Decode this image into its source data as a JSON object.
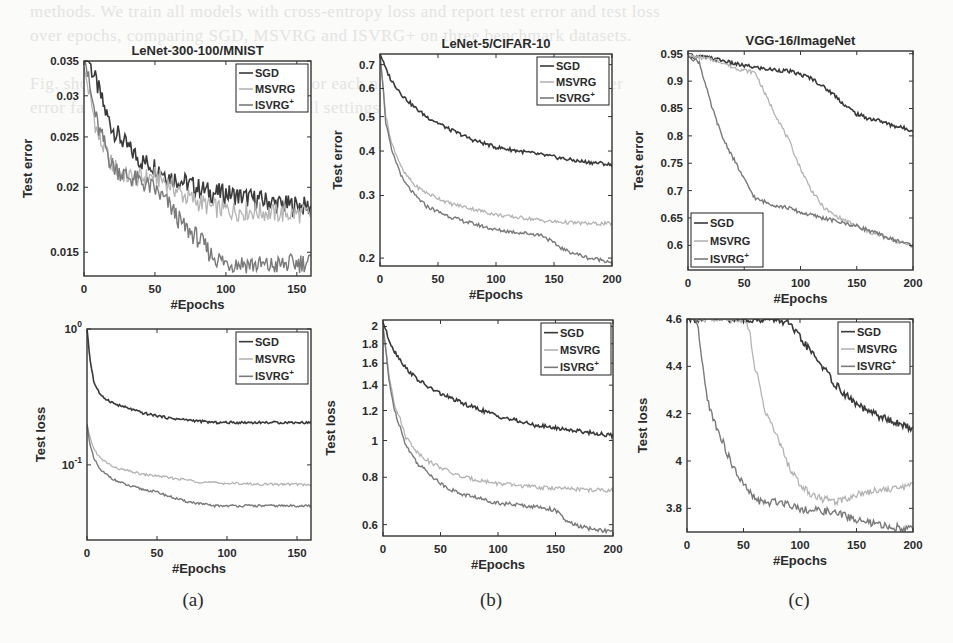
{
  "figure": {
    "background_text_lines": [
      "methods. We train all models with cross-entropy loss and report test error and test loss",
      "over epochs, comparing SGD, MSVRG and ISVRG+ on three benchmark datasets.",
      "",
      "Fig. shows the test error and test loss for each network. Our method attains lower",
      "error faster than the baselines across all settings considered in this experiment.",
      "",
      "",
      "",
      "",
      "",
      "",
      "",
      "",
      "",
      "",
      "",
      "",
      "",
      "",
      "",
      "",
      "",
      "",
      "",
      "",
      "",
      ""
    ],
    "captions": [
      "(a)",
      "(b)",
      "(c)"
    ],
    "series_colors": {
      "SGD": "#3a3a3a",
      "MSVRG": "#b4b4b4",
      "ISVRG+": "#7a7a7a"
    }
  },
  "chart_data": [
    {
      "type": "line",
      "panel": "a-top",
      "title": "LeNet-300-100/MNIST",
      "xlabel": "#Epochs",
      "ylabel": "Test error",
      "xlim": [
        0,
        160
      ],
      "ylim": [
        0.0135,
        0.035
      ],
      "yscale": "log",
      "xticks": [
        0,
        50,
        100,
        150
      ],
      "yticks": [
        0.015,
        0.02,
        0.025,
        0.03,
        0.035
      ],
      "ytick_labels": [
        "0.015",
        "0.02",
        "0.025",
        "0.03",
        "0.035"
      ],
      "legend": {
        "position": "upper right",
        "entries": [
          "SGD",
          "MSVRG",
          "ISVRG+"
        ]
      },
      "grid": false,
      "x": [
        0,
        5,
        10,
        15,
        20,
        25,
        30,
        40,
        50,
        60,
        70,
        80,
        90,
        100,
        110,
        120,
        130,
        140,
        150,
        160
      ],
      "series": [
        {
          "name": "SGD",
          "values": [
            0.038,
            0.034,
            0.031,
            0.028,
            0.026,
            0.025,
            0.024,
            0.0225,
            0.022,
            0.021,
            0.0205,
            0.02,
            0.0195,
            0.0195,
            0.0192,
            0.019,
            0.0188,
            0.0185,
            0.0185,
            0.0183
          ]
        },
        {
          "name": "MSVRG",
          "values": [
            0.034,
            0.029,
            0.025,
            0.0235,
            0.022,
            0.0215,
            0.021,
            0.0208,
            0.021,
            0.0203,
            0.0193,
            0.0188,
            0.0183,
            0.0181,
            0.018,
            0.018,
            0.0179,
            0.0178,
            0.0178,
            0.0178
          ]
        },
        {
          "name": "ISVRG+",
          "values": [
            0.036,
            0.03,
            0.026,
            0.024,
            0.022,
            0.0215,
            0.021,
            0.0205,
            0.0198,
            0.0185,
            0.0168,
            0.016,
            0.0148,
            0.0143,
            0.0143,
            0.0142,
            0.0141,
            0.0142,
            0.0143,
            0.0144
          ]
        }
      ]
    },
    {
      "type": "line",
      "panel": "b-top",
      "title": "LeNet-5/CIFAR-10",
      "xlabel": "#Epochs",
      "ylabel": "Test error",
      "xlim": [
        0,
        200
      ],
      "ylim": [
        0.19,
        0.75
      ],
      "yscale": "log",
      "xticks": [
        0,
        50,
        100,
        150,
        200
      ],
      "yticks": [
        0.2,
        0.3,
        0.4,
        0.5,
        0.6,
        0.7
      ],
      "ytick_labels": [
        "0.2",
        "0.3",
        "0.4",
        "0.5",
        "0.6",
        "0.7"
      ],
      "legend": {
        "position": "upper right",
        "entries": [
          "SGD",
          "MSVRG",
          "ISVRG+"
        ]
      },
      "grid": false,
      "x": [
        0,
        5,
        10,
        20,
        30,
        40,
        50,
        60,
        70,
        80,
        90,
        100,
        110,
        120,
        130,
        140,
        150,
        160,
        170,
        180,
        190,
        200
      ],
      "series": [
        {
          "name": "SGD",
          "values": [
            0.75,
            0.68,
            0.63,
            0.57,
            0.53,
            0.5,
            0.48,
            0.46,
            0.445,
            0.43,
            0.42,
            0.41,
            0.405,
            0.4,
            0.395,
            0.39,
            0.385,
            0.38,
            0.375,
            0.372,
            0.37,
            0.365
          ]
        },
        {
          "name": "MSVRG",
          "values": [
            0.74,
            0.5,
            0.42,
            0.35,
            0.32,
            0.305,
            0.295,
            0.285,
            0.28,
            0.275,
            0.27,
            0.265,
            0.262,
            0.26,
            0.258,
            0.255,
            0.253,
            0.252,
            0.251,
            0.25,
            0.25,
            0.25
          ]
        },
        {
          "name": "ISVRG+",
          "values": [
            0.74,
            0.48,
            0.4,
            0.33,
            0.3,
            0.28,
            0.27,
            0.262,
            0.255,
            0.25,
            0.245,
            0.24,
            0.238,
            0.236,
            0.234,
            0.232,
            0.22,
            0.21,
            0.205,
            0.2,
            0.198,
            0.195
          ]
        }
      ]
    },
    {
      "type": "line",
      "panel": "c-top",
      "title": "VGG-16/ImageNet",
      "xlabel": "#Epochs",
      "ylabel": "Test error",
      "xlim": [
        0,
        200
      ],
      "ylim": [
        0.555,
        0.955
      ],
      "yscale": "linear",
      "xticks": [
        0,
        50,
        100,
        150,
        200
      ],
      "yticks": [
        0.6,
        0.65,
        0.7,
        0.75,
        0.8,
        0.85,
        0.9,
        0.95
      ],
      "ytick_labels": [
        "0.6",
        "0.65",
        "0.7",
        "0.75",
        "0.8",
        "0.85",
        "0.9",
        "0.95"
      ],
      "legend": {
        "position": "lower left",
        "entries": [
          "SGD",
          "MSVRG",
          "ISVRG+"
        ]
      },
      "grid": false,
      "x": [
        0,
        10,
        20,
        30,
        40,
        50,
        60,
        70,
        80,
        90,
        100,
        110,
        120,
        130,
        140,
        150,
        160,
        170,
        180,
        190,
        200
      ],
      "series": [
        {
          "name": "SGD",
          "values": [
            0.945,
            0.945,
            0.942,
            0.938,
            0.932,
            0.928,
            0.925,
            0.922,
            0.92,
            0.918,
            0.912,
            0.905,
            0.89,
            0.875,
            0.855,
            0.84,
            0.832,
            0.828,
            0.82,
            0.815,
            0.81
          ]
        },
        {
          "name": "MSVRG",
          "values": [
            0.945,
            0.943,
            0.94,
            0.935,
            0.925,
            0.92,
            0.915,
            0.87,
            0.83,
            0.79,
            0.74,
            0.7,
            0.67,
            0.655,
            0.645,
            0.635,
            0.625,
            0.618,
            0.61,
            0.605,
            0.6
          ]
        },
        {
          "name": "ISVRG+",
          "values": [
            0.945,
            0.935,
            0.86,
            0.8,
            0.76,
            0.72,
            0.685,
            0.678,
            0.672,
            0.668,
            0.66,
            0.655,
            0.65,
            0.645,
            0.64,
            0.635,
            0.628,
            0.62,
            0.612,
            0.606,
            0.6
          ]
        }
      ]
    },
    {
      "type": "line",
      "panel": "a-bottom",
      "title": "",
      "xlabel": "#Epochs",
      "ylabel": "Test loss",
      "xlim": [
        0,
        160
      ],
      "ylim": [
        0.028,
        1.0
      ],
      "yscale": "log",
      "xticks": [
        0,
        50,
        100,
        150
      ],
      "yticks": [
        0.1,
        1.0
      ],
      "ytick_labels": [
        "10^-1",
        "10^0"
      ],
      "legend": {
        "position": "upper right",
        "entries": [
          "SGD",
          "MSVRG",
          "ISVRG+"
        ]
      },
      "grid": false,
      "x": [
        0,
        2,
        5,
        10,
        20,
        30,
        40,
        50,
        60,
        70,
        80,
        90,
        100,
        110,
        120,
        130,
        140,
        150,
        160
      ],
      "series": [
        {
          "name": "SGD",
          "values": [
            1.0,
            0.6,
            0.4,
            0.32,
            0.28,
            0.26,
            0.24,
            0.23,
            0.22,
            0.215,
            0.21,
            0.205,
            0.205,
            0.205,
            0.205,
            0.205,
            0.205,
            0.205,
            0.205
          ]
        },
        {
          "name": "MSVRG",
          "values": [
            0.2,
            0.16,
            0.13,
            0.11,
            0.095,
            0.09,
            0.085,
            0.083,
            0.08,
            0.078,
            0.075,
            0.074,
            0.073,
            0.073,
            0.072,
            0.072,
            0.072,
            0.072,
            0.071
          ]
        },
        {
          "name": "ISVRG+",
          "values": [
            0.2,
            0.14,
            0.11,
            0.09,
            0.077,
            0.07,
            0.066,
            0.063,
            0.058,
            0.054,
            0.052,
            0.05,
            0.05,
            0.05,
            0.05,
            0.05,
            0.05,
            0.05,
            0.05
          ]
        }
      ]
    },
    {
      "type": "line",
      "panel": "b-bottom",
      "title": "",
      "xlabel": "#Epochs",
      "ylabel": "Test loss",
      "xlim": [
        0,
        200
      ],
      "ylim": [
        0.56,
        2.08
      ],
      "yscale": "log",
      "xticks": [
        0,
        50,
        100,
        150,
        200
      ],
      "yticks": [
        0.6,
        0.8,
        1.0,
        1.2,
        1.4,
        1.6,
        1.8,
        2.0
      ],
      "ytick_labels": [
        "0.6",
        "0.8",
        "1",
        "1.2",
        "1.4",
        "1.6",
        "1.8",
        "2"
      ],
      "legend": {
        "position": "upper right",
        "entries": [
          "SGD",
          "MSVRG",
          "ISVRG+"
        ]
      },
      "grid": false,
      "x": [
        0,
        5,
        10,
        20,
        30,
        40,
        50,
        60,
        70,
        80,
        90,
        100,
        110,
        120,
        130,
        140,
        150,
        160,
        170,
        180,
        190,
        200
      ],
      "series": [
        {
          "name": "SGD",
          "values": [
            2.05,
            1.85,
            1.72,
            1.55,
            1.45,
            1.38,
            1.33,
            1.29,
            1.25,
            1.22,
            1.19,
            1.16,
            1.14,
            1.12,
            1.1,
            1.09,
            1.08,
            1.07,
            1.06,
            1.05,
            1.04,
            1.03
          ]
        },
        {
          "name": "MSVRG",
          "values": [
            2.0,
            1.5,
            1.25,
            1.02,
            0.93,
            0.88,
            0.85,
            0.82,
            0.8,
            0.79,
            0.78,
            0.77,
            0.765,
            0.76,
            0.755,
            0.75,
            0.75,
            0.745,
            0.745,
            0.74,
            0.74,
            0.74
          ]
        },
        {
          "name": "ISVRG+",
          "values": [
            2.0,
            1.45,
            1.2,
            0.97,
            0.87,
            0.82,
            0.77,
            0.74,
            0.72,
            0.71,
            0.695,
            0.685,
            0.68,
            0.675,
            0.67,
            0.665,
            0.655,
            0.61,
            0.595,
            0.585,
            0.58,
            0.575
          ]
        }
      ]
    },
    {
      "type": "line",
      "panel": "c-bottom",
      "title": "",
      "xlabel": "#Epochs",
      "ylabel": "Test loss",
      "xlim": [
        0,
        200
      ],
      "ylim": [
        3.7,
        4.6
      ],
      "yscale": "linear",
      "xticks": [
        0,
        50,
        100,
        150,
        200
      ],
      "yticks": [
        3.8,
        4.0,
        4.2,
        4.4,
        4.6
      ],
      "ytick_labels": [
        "3.8",
        "4",
        "4.2",
        "4.4",
        "4.6"
      ],
      "legend": {
        "position": "upper right",
        "entries": [
          "SGD",
          "MSVRG",
          "ISVRG+"
        ]
      },
      "grid": false,
      "x": [
        0,
        8,
        10,
        15,
        20,
        30,
        40,
        50,
        55,
        60,
        70,
        80,
        90,
        100,
        110,
        120,
        130,
        140,
        150,
        160,
        170,
        180,
        190,
        200
      ],
      "series": [
        {
          "name": "SGD",
          "values": [
            4.6,
            4.6,
            4.6,
            4.6,
            4.6,
            4.6,
            4.6,
            4.6,
            4.6,
            4.6,
            4.6,
            4.6,
            4.58,
            4.52,
            4.46,
            4.4,
            4.33,
            4.28,
            4.24,
            4.21,
            4.19,
            4.17,
            4.15,
            4.14
          ]
        },
        {
          "name": "MSVRG",
          "values": [
            4.6,
            4.6,
            4.6,
            4.6,
            4.6,
            4.6,
            4.6,
            4.6,
            4.56,
            4.4,
            4.2,
            4.1,
            3.98,
            3.9,
            3.86,
            3.84,
            3.83,
            3.84,
            3.86,
            3.87,
            3.88,
            3.88,
            3.89,
            3.9
          ]
        },
        {
          "name": "ISVRG+",
          "values": [
            4.6,
            4.6,
            4.55,
            4.35,
            4.22,
            4.1,
            3.98,
            3.9,
            3.87,
            3.84,
            3.82,
            3.83,
            3.82,
            3.8,
            3.79,
            3.79,
            3.78,
            3.77,
            3.75,
            3.74,
            3.73,
            3.72,
            3.72,
            3.71
          ]
        }
      ]
    }
  ]
}
